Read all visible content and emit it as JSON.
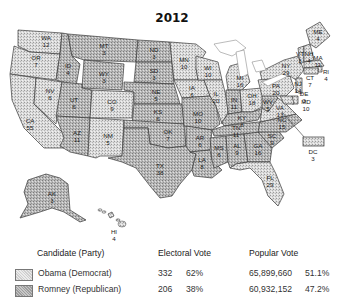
{
  "title": "2012",
  "colors": {
    "democrat_fill": "#d9d9d9",
    "republican_fill": "#b2b2b2",
    "border": "#3a3a3a",
    "water": "#ffffff"
  },
  "map": {
    "states": [
      {
        "abbr": "WA",
        "ev": "12"
      },
      {
        "abbr": "OR",
        "ev": "7"
      },
      {
        "abbr": "CA",
        "ev": "55"
      },
      {
        "abbr": "NV",
        "ev": "6"
      },
      {
        "abbr": "ID",
        "ev": "4"
      },
      {
        "abbr": "MT",
        "ev": "3"
      },
      {
        "abbr": "WY",
        "ev": "3"
      },
      {
        "abbr": "UT",
        "ev": "6"
      },
      {
        "abbr": "AZ",
        "ev": "11"
      },
      {
        "abbr": "CO",
        "ev": "9"
      },
      {
        "abbr": "NM",
        "ev": "5"
      },
      {
        "abbr": "ND",
        "ev": "3"
      },
      {
        "abbr": "SD",
        "ev": "3"
      },
      {
        "abbr": "NE",
        "ev": "5"
      },
      {
        "abbr": "KS",
        "ev": "6"
      },
      {
        "abbr": "OK",
        "ev": "7"
      },
      {
        "abbr": "TX",
        "ev": "38"
      },
      {
        "abbr": "MN",
        "ev": "10"
      },
      {
        "abbr": "IA",
        "ev": "6"
      },
      {
        "abbr": "MO",
        "ev": "10"
      },
      {
        "abbr": "AR",
        "ev": "6"
      },
      {
        "abbr": "LA",
        "ev": "8"
      },
      {
        "abbr": "WI",
        "ev": "10"
      },
      {
        "abbr": "IL",
        "ev": "20"
      },
      {
        "abbr": "MI",
        "ev": "16"
      },
      {
        "abbr": "IN",
        "ev": "11"
      },
      {
        "abbr": "OH",
        "ev": "18"
      },
      {
        "abbr": "KY",
        "ev": "8"
      },
      {
        "abbr": "TN",
        "ev": "11"
      },
      {
        "abbr": "MS",
        "ev": "6"
      },
      {
        "abbr": "AL",
        "ev": "9"
      },
      {
        "abbr": "GA",
        "ev": "16"
      },
      {
        "abbr": "FL",
        "ev": "29"
      },
      {
        "abbr": "SC",
        "ev": "9"
      },
      {
        "abbr": "NC",
        "ev": "15"
      },
      {
        "abbr": "VA",
        "ev": "13"
      },
      {
        "abbr": "WV",
        "ev": "5"
      },
      {
        "abbr": "PA",
        "ev": "20"
      },
      {
        "abbr": "NY",
        "ev": "29"
      },
      {
        "abbr": "VT",
        "ev": "3"
      },
      {
        "abbr": "NH",
        "ev": "4"
      },
      {
        "abbr": "ME",
        "ev": "4"
      },
      {
        "abbr": "MA",
        "ev": "11"
      },
      {
        "abbr": "RI",
        "ev": "4"
      },
      {
        "abbr": "CT",
        "ev": "7"
      },
      {
        "abbr": "NJ",
        "ev": "14"
      },
      {
        "abbr": "DE",
        "ev": "3"
      },
      {
        "abbr": "MD",
        "ev": "10"
      },
      {
        "abbr": "DC",
        "ev": "3"
      },
      {
        "abbr": "AK",
        "ev": "3"
      },
      {
        "abbr": "HI",
        "ev": "4"
      }
    ]
  },
  "legend": {
    "headers": {
      "candidate": "Candidate (Party)",
      "electoral": "Electoral Vote",
      "popular": "Popular Vote"
    },
    "rows": [
      {
        "candidate": "Obama (Democrat)",
        "party": "democrat",
        "electoral_votes": "332",
        "electoral_pct": "62%",
        "popular_votes": "65,899,660",
        "popular_pct": "51.1%"
      },
      {
        "candidate": "Romney (Republican)",
        "party": "republican",
        "electoral_votes": "206",
        "electoral_pct": "38%",
        "popular_votes": "60,932,152",
        "popular_pct": "47.2%"
      }
    ]
  }
}
